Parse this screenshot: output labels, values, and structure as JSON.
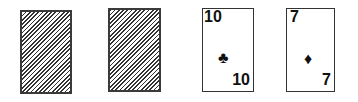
{
  "table": {
    "cards": [
      {
        "face_down": true,
        "back": "striped-back"
      },
      {
        "face_down": true,
        "back": "striped-back"
      },
      {
        "face_down": false,
        "rank": "10",
        "suit": "clubs",
        "suit_glyph": "♣",
        "color": "#111111"
      },
      {
        "face_down": false,
        "rank": "7",
        "suit": "diamonds",
        "suit_glyph": "♦",
        "color": "#111111"
      }
    ]
  }
}
